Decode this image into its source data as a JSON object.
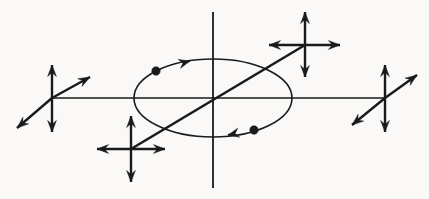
{
  "canvas": {
    "width": 429,
    "height": 199,
    "background_color": "#faf9f7",
    "stroke_color": "#1a1a1a",
    "title": "Orbital motion diagram with force-vector crosses"
  },
  "figure": {
    "type": "vector-diagram",
    "ellipse": {
      "name": "orbit-ellipse",
      "center_x": 213,
      "center_y": 98,
      "radius_x": 79,
      "radius_y": 39,
      "stroke_width": 1.6,
      "rotation_deg": 0
    },
    "axes": [
      {
        "name": "vertical-axis",
        "x1": 213,
        "y1": 12,
        "x2": 213,
        "y2": 188,
        "stroke_width": 1.8,
        "arrowheads": "none"
      },
      {
        "name": "horizontal-axis",
        "x1": 52,
        "y1": 98,
        "x2": 385,
        "y2": 98,
        "stroke_width": 1.6,
        "arrowheads": "none"
      },
      {
        "name": "diagonal-axis",
        "x1": 131,
        "y1": 149,
        "x2": 305,
        "y2": 45,
        "stroke_width": 2.6,
        "arrowheads": "none"
      }
    ],
    "point_masses": [
      {
        "name": "point-mass-upper-left",
        "cx": 156,
        "cy": 71,
        "r": 4.2
      },
      {
        "name": "point-mass-lower-right",
        "cx": 254,
        "cy": 130,
        "r": 4.2
      }
    ],
    "orbit_direction_arrows": [
      {
        "name": "orbit-direction-arrow-top",
        "x": 190,
        "y": 61,
        "angle_deg": -15,
        "label": "clockwise-top"
      },
      {
        "name": "orbit-direction-arrow-bottom",
        "x": 228,
        "y": 135,
        "angle_deg": 168,
        "label": "clockwise-bottom"
      }
    ],
    "vector_crosses": [
      {
        "name": "vector-cross-left",
        "center_x": 52,
        "center_y": 98,
        "style": "vertical-and-diagonal",
        "arms": [
          {
            "name": "arrow-up",
            "dx": 0,
            "dy": -33
          },
          {
            "name": "arrow-down",
            "dx": 0,
            "dy": 34
          },
          {
            "name": "arrow-up-right",
            "dx": 38,
            "dy": -21
          },
          {
            "name": "arrow-down-left",
            "dx": -35,
            "dy": 30
          }
        ]
      },
      {
        "name": "vector-cross-right",
        "center_x": 385,
        "center_y": 98,
        "style": "vertical-and-diagonal",
        "arms": [
          {
            "name": "arrow-up",
            "dx": 0,
            "dy": -33
          },
          {
            "name": "arrow-down",
            "dx": 0,
            "dy": 34
          },
          {
            "name": "arrow-up-right",
            "dx": 32,
            "dy": -23
          },
          {
            "name": "arrow-down-left",
            "dx": -33,
            "dy": 27
          }
        ]
      },
      {
        "name": "vector-cross-top-right",
        "center_x": 305,
        "center_y": 45,
        "style": "vertical-and-horizontal",
        "arms": [
          {
            "name": "arrow-up",
            "dx": 0,
            "dy": -33
          },
          {
            "name": "arrow-down",
            "dx": 0,
            "dy": 32
          },
          {
            "name": "arrow-right",
            "dx": 35,
            "dy": 0
          },
          {
            "name": "arrow-left",
            "dx": -36,
            "dy": 0
          }
        ]
      },
      {
        "name": "vector-cross-bottom-left",
        "center_x": 131,
        "center_y": 149,
        "style": "vertical-and-horizontal",
        "arms": [
          {
            "name": "arrow-up",
            "dx": 0,
            "dy": -33
          },
          {
            "name": "arrow-down",
            "dx": 0,
            "dy": 33
          },
          {
            "name": "arrow-right",
            "dx": 34,
            "dy": 0
          },
          {
            "name": "arrow-left",
            "dx": -34,
            "dy": 0
          }
        ]
      }
    ]
  }
}
